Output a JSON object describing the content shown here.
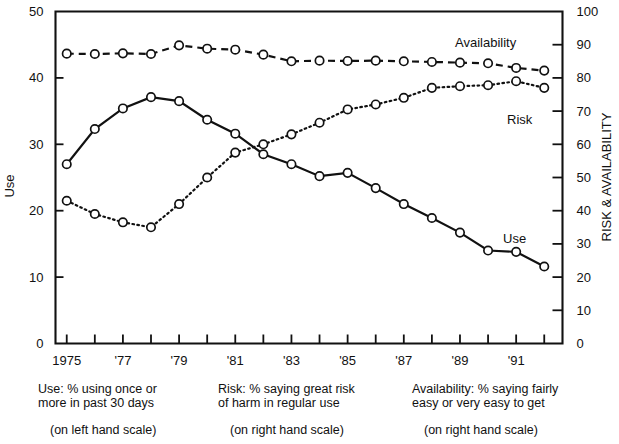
{
  "chart_data": {
    "type": "line",
    "title": "",
    "xlabel": "",
    "ylabel": "Use",
    "y2label": "RISK & AVAILABILITY",
    "ylim": [
      0,
      50
    ],
    "y2lim": [
      0,
      100
    ],
    "grid": false,
    "legend": "inline-end-labels",
    "x": [
      1975,
      1976,
      1977,
      1978,
      1979,
      1980,
      1981,
      1982,
      1983,
      1984,
      1985,
      1986,
      1987,
      1988,
      1989,
      1990,
      1991,
      1992
    ],
    "x_tick_labels": [
      "1975",
      "",
      "'77",
      "",
      "'79",
      "",
      "'81",
      "",
      "'83",
      "",
      "'85",
      "",
      "'87",
      "",
      "'89",
      "",
      "'91",
      ""
    ],
    "y_tick_labels": [
      "0",
      "10",
      "20",
      "30",
      "40",
      "50"
    ],
    "y_tick_values": [
      0,
      10,
      20,
      30,
      40,
      50
    ],
    "y2_tick_labels": [
      "0",
      "10",
      "20",
      "30",
      "40",
      "50",
      "60",
      "70",
      "80",
      "90",
      "100"
    ],
    "y2_tick_values": [
      0,
      10,
      20,
      30,
      40,
      50,
      60,
      70,
      80,
      90,
      100
    ],
    "series": [
      {
        "name": "Use",
        "axis": "left",
        "style": "solid",
        "label": "Use",
        "values": [
          27.0,
          32.3,
          35.4,
          37.1,
          36.5,
          33.7,
          31.6,
          28.5,
          27.0,
          25.2,
          25.7,
          23.4,
          21.0,
          18.9,
          16.7,
          14.0,
          13.8,
          11.6
        ]
      },
      {
        "name": "Risk",
        "axis": "right",
        "style": "dotted",
        "label": "Risk",
        "values": [
          43.0,
          39.0,
          36.5,
          35.0,
          42.0,
          50.0,
          57.5,
          60.0,
          63.0,
          66.5,
          70.5,
          72.0,
          74.0,
          77.0,
          77.5,
          77.8,
          79.0,
          77.0
        ]
      },
      {
        "name": "Availability",
        "axis": "right",
        "style": "dashed",
        "label": "Availability",
        "values": [
          87.3,
          87.2,
          87.4,
          87.2,
          89.8,
          88.8,
          88.5,
          87.0,
          85.0,
          85.2,
          85.1,
          85.2,
          85.0,
          84.8,
          84.6,
          84.4,
          83.0,
          82.2
        ]
      }
    ],
    "captions": [
      {
        "line1": "Use: % using once or",
        "line2": "more in past 30 days",
        "line3": "(on left hand scale)"
      },
      {
        "line1": "Risk: % saying great risk",
        "line2": "of harm in regular use",
        "line3": "(on right hand scale)"
      },
      {
        "line1": "Availability: % saying fairly",
        "line2": "easy or very easy to get",
        "line3": "(on right hand scale)"
      }
    ],
    "colors": {
      "ink": "#111111",
      "background": "#ffffff",
      "marker_fill": "#ffffff"
    }
  }
}
